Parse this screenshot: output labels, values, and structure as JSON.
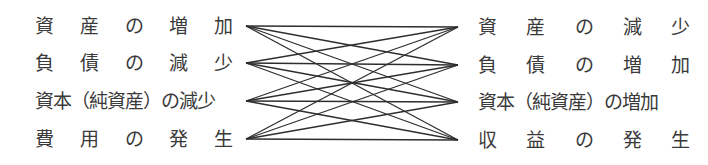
{
  "diagram": {
    "left_items": [
      {
        "chars": [
          "資",
          "産",
          "の",
          "増",
          "加"
        ],
        "text": "資産の増加",
        "y": 26
      },
      {
        "chars": [
          "負",
          "債",
          "の",
          "減",
          "少"
        ],
        "text": "負債の減少",
        "y": 63
      },
      {
        "text": "資本（純資産）の減少",
        "y": 101,
        "tight": true
      },
      {
        "chars": [
          "費",
          "用",
          "の",
          "発",
          "生"
        ],
        "text": "費用の発生",
        "y": 139
      }
    ],
    "right_items": [
      {
        "chars": [
          "資",
          "産",
          "の",
          "減",
          "少"
        ],
        "text": "資産の減少",
        "y": 27
      },
      {
        "chars": [
          "負",
          "債",
          "の",
          "増",
          "加"
        ],
        "text": "負債の増加",
        "y": 65
      },
      {
        "text": "資本（純資産）の増加",
        "y": 102,
        "tight": true
      },
      {
        "chars": [
          "収",
          "益",
          "の",
          "発",
          "生"
        ],
        "text": "収益の発生",
        "y": 140
      }
    ],
    "left_anchor_x": 246,
    "right_anchor_x": 458,
    "connections": "complete-bipartite",
    "line_color": "#2e2e2e"
  }
}
